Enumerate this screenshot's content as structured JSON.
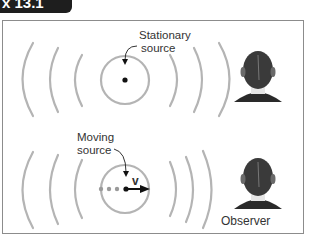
{
  "figure": {
    "tab_label": "x 13.1"
  },
  "top_panel": {
    "label_line1": "Stationary",
    "label_line2": "source"
  },
  "bottom_panel": {
    "label_line1": "Moving",
    "label_line2": "source",
    "velocity_symbol": "v",
    "observer_label": "Observer"
  },
  "colors": {
    "wave": "#b4b4b4",
    "frame": "#8c8c8c",
    "tab": "#1e1e1e",
    "source_dot": "#111111",
    "trail_dots": "#9a9a9a"
  }
}
